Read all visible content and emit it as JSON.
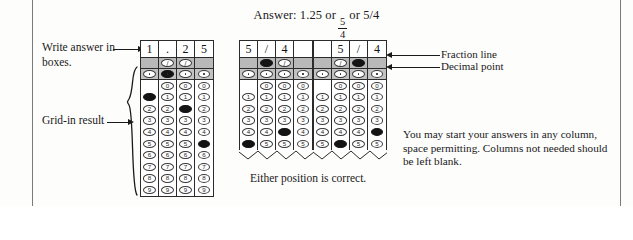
{
  "header": {
    "answer_prefix": "Answer: 1.25 or",
    "fraction_numerator": "5",
    "fraction_denominator": "4",
    "answer_suffix": "or 5/4"
  },
  "labels": {
    "write_answer": "Write answer in boxes.",
    "write_answer_line1": "Write answer in",
    "write_answer_line2": "boxes.",
    "grid_in_result": "Grid-in result",
    "fraction_line": "Fraction line",
    "decimal_point": "Decimal point",
    "either_position": "Either position is correct.",
    "note_paragraph": "You may start your answers in any column, space permitting. Columns not needed should be left blank."
  },
  "bubble_glyphs": {
    "slash": "/",
    "dot": ".",
    "digits": [
      "0",
      "1",
      "2",
      "3",
      "4",
      "5",
      "6",
      "7",
      "8",
      "9"
    ]
  },
  "grids": [
    {
      "id": "grid-decimal",
      "written": [
        "1",
        ".",
        "2",
        "5"
      ],
      "fraction_row": [
        null,
        "slash",
        "slash",
        null
      ],
      "decimal_row": [
        "dot",
        "dot",
        "dot",
        "dot"
      ],
      "fraction_filled": [
        false,
        false,
        false,
        false
      ],
      "decimal_filled": [
        false,
        true,
        false,
        false
      ],
      "digit_rows_start": 0,
      "zero_row_blank_columns": [
        0
      ],
      "filled_digits": [
        1,
        null,
        2,
        5
      ],
      "truncated": false,
      "digits_shown": [
        "0",
        "1",
        "2",
        "3",
        "4",
        "5",
        "6",
        "7",
        "8",
        "9"
      ]
    },
    {
      "id": "grid-fraction-left",
      "written": [
        "5",
        "/",
        "4",
        ""
      ],
      "fraction_row": [
        null,
        "slash",
        "slash",
        null
      ],
      "decimal_row": [
        "dot",
        "dot",
        "dot",
        "dot"
      ],
      "fraction_filled": [
        false,
        true,
        false,
        false
      ],
      "decimal_filled": [
        false,
        false,
        false,
        false
      ],
      "zero_row_blank_columns": [
        0
      ],
      "filled_digits": [
        5,
        null,
        4,
        null
      ],
      "truncated": true,
      "digits_shown": [
        "0",
        "1",
        "2",
        "3",
        "4",
        "5"
      ]
    },
    {
      "id": "grid-fraction-right",
      "written": [
        "",
        "5",
        "/",
        "4"
      ],
      "fraction_row": [
        null,
        "slash",
        "slash",
        null
      ],
      "decimal_row": [
        "dot",
        "dot",
        "dot",
        "dot"
      ],
      "fraction_filled": [
        false,
        false,
        true,
        false
      ],
      "decimal_filled": [
        false,
        false,
        false,
        false
      ],
      "zero_row_blank_columns": [
        0
      ],
      "filled_digits": [
        null,
        5,
        null,
        4
      ],
      "truncated": true,
      "digits_shown": [
        "0",
        "1",
        "2",
        "3",
        "4",
        "5"
      ]
    }
  ],
  "colors": {
    "ink": "#1a1a1a",
    "grid_border": "#2b2b2b",
    "shaded_row": "#bdbdbd",
    "filled_bubble": "#141414",
    "page_rule": "#7a7a7a"
  }
}
